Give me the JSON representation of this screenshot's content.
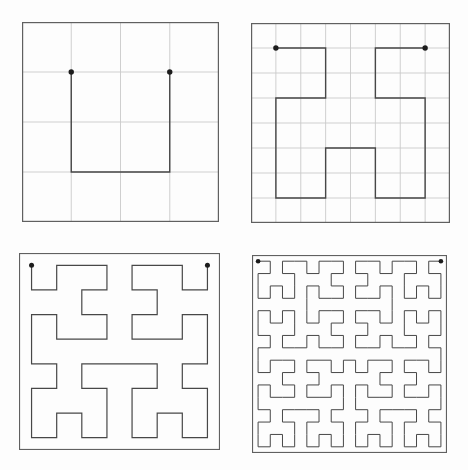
{
  "figure": {
    "width": 468,
    "height": 470,
    "background": "#fdfdfd",
    "curve_type": "hilbert-space-filling-curve",
    "colors": {
      "panel_border": "#606060",
      "grid_line": "#c9c9c9",
      "curve": "#474747",
      "endpoint_dot": "#1c1c1c"
    },
    "panels": [
      {
        "name": "hilbert-order-1",
        "order": 1,
        "units": 4,
        "grid_divisions": 4,
        "show_grid": true,
        "frame": {
          "left": 22,
          "top": 22,
          "width": 197,
          "height": 200
        },
        "border_width": 1.2,
        "grid_width": 0.9,
        "curve_width": 1.4,
        "dot_radius": 2.7,
        "start_point": [
          1,
          1
        ],
        "end_point": [
          3,
          1
        ]
      },
      {
        "name": "hilbert-order-2",
        "order": 2,
        "units": 8,
        "grid_divisions": 8,
        "show_grid": true,
        "frame": {
          "left": 251,
          "top": 23,
          "width": 199,
          "height": 200
        },
        "border_width": 1.2,
        "grid_width": 0.9,
        "curve_width": 1.4,
        "dot_radius": 2.7,
        "start_point": [
          1,
          1
        ],
        "end_point": [
          7,
          1
        ]
      },
      {
        "name": "hilbert-order-3",
        "order": 3,
        "units": 16,
        "grid_divisions": 0,
        "show_grid": false,
        "frame": {
          "left": 19,
          "top": 253,
          "width": 201,
          "height": 197
        },
        "border_width": 1.1,
        "grid_width": 0,
        "curve_width": 1.2,
        "dot_radius": 2.5,
        "start_point": [
          1,
          1
        ],
        "end_point": [
          15,
          1
        ]
      },
      {
        "name": "hilbert-order-4",
        "order": 4,
        "units": 32,
        "grid_divisions": 0,
        "show_grid": false,
        "frame": {
          "left": 252,
          "top": 255,
          "width": 195,
          "height": 198
        },
        "border_width": 1.1,
        "grid_width": 0,
        "curve_width": 1.0,
        "dot_radius": 2.3,
        "start_point": [
          1,
          1
        ],
        "end_point": [
          31,
          1
        ]
      }
    ]
  }
}
